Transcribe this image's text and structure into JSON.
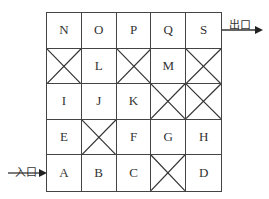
{
  "diagram": {
    "type": "maze-grid",
    "rows": 5,
    "cols": 5,
    "blocked_marker": "X",
    "cells": [
      [
        "N",
        "O",
        "P",
        "Q",
        "S"
      ],
      [
        "X",
        "L",
        "X",
        "M",
        "X"
      ],
      [
        "I",
        "J",
        "K",
        "X",
        "X"
      ],
      [
        "E",
        "X",
        "F",
        "G",
        "H"
      ],
      [
        "A",
        "B",
        "C",
        "X",
        "D"
      ]
    ],
    "entrance": {
      "label": "入口",
      "cell": "A",
      "side": "left"
    },
    "exit": {
      "label": "出口",
      "cell": "S",
      "side": "right"
    }
  }
}
